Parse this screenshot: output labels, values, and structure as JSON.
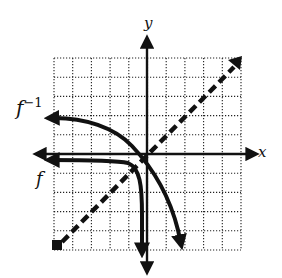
{
  "chart_data": {
    "type": "line",
    "title": "",
    "xlabel": "x",
    "ylabel": "y",
    "xlim": [
      -5,
      5
    ],
    "ylim": [
      -5,
      5
    ],
    "grid": true,
    "grid_style": "dotted",
    "tick_labels_shown": false,
    "series": [
      {
        "name": "f^{-1}",
        "label": "f",
        "superscript": "−1",
        "style": "solid-arrows",
        "points": [
          [
            -5.3,
            1.9
          ],
          [
            -3,
            1.6
          ],
          [
            -1.5,
            1.0
          ],
          [
            -0.6,
            0.1
          ],
          [
            0,
            -0.6
          ],
          [
            1,
            -1.8
          ],
          [
            1.6,
            -3.2
          ],
          [
            1.9,
            -5.0
          ]
        ]
      },
      {
        "name": "f",
        "label": "f",
        "superscript": "",
        "style": "solid-arrows",
        "points": [
          [
            -5.3,
            -0.3
          ],
          [
            -3,
            -0.4
          ],
          [
            -1.5,
            -0.5
          ],
          [
            -0.8,
            -0.7
          ],
          [
            -0.4,
            -1.3
          ],
          [
            -0.3,
            -2.5
          ],
          [
            -0.2,
            -4.0
          ],
          [
            -0.2,
            -5.6
          ]
        ]
      },
      {
        "name": "y = x",
        "label": "",
        "style": "dashed",
        "points": [
          [
            -4.7,
            -4.7
          ],
          [
            4.7,
            4.7
          ]
        ]
      }
    ],
    "legend": "none",
    "annotations": [
      {
        "text": "f⁻¹",
        "near": "left end of upper curve"
      },
      {
        "text": "f",
        "near": "left end of lower curve"
      }
    ]
  },
  "labels": {
    "x_axis": "x",
    "y_axis": "y",
    "f_inverse": "f",
    "f_inverse_sup": "−1",
    "f": "f"
  }
}
